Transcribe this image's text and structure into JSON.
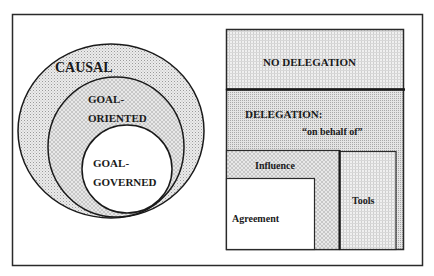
{
  "left_panel": {
    "circles": [
      {
        "label": "CAUSAL"
      },
      {
        "label_line1": "GOAL-",
        "label_line2": "ORIENTED"
      },
      {
        "label_line1": "GOAL-",
        "label_line2": "GOVERNED"
      }
    ]
  },
  "right_panel": {
    "no_delegation": "NO DELEGATION",
    "delegation": "DELEGATION:",
    "delegation_sub": "“on behalf of”",
    "influence": "Influence",
    "agreement": "Agreement",
    "tools": "Tools"
  },
  "colors": {
    "line": "#2a2a2a",
    "shade": "#d9d9d9",
    "background": "#ffffff"
  }
}
